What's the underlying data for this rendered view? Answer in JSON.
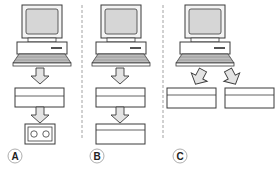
{
  "diagram": {
    "colors": {
      "stroke": "#3a3a3a",
      "screen_fill": "#d6d6d6",
      "arrow_fill": "#e4e4e4",
      "box_fill": "#ffffff",
      "divider": "#8a8a8a",
      "label_circle": "#999999"
    },
    "panels": [
      {
        "id": "A",
        "label": "A",
        "components": [
          "computer",
          "arrow-down",
          "output-box",
          "arrow-down",
          "cassette-device"
        ]
      },
      {
        "id": "B",
        "label": "B",
        "components": [
          "computer",
          "arrow-down",
          "output-box",
          "arrow-down",
          "output-box"
        ]
      },
      {
        "id": "C",
        "label": "C",
        "components": [
          "computer",
          "arrow-down-left",
          "arrow-down-right",
          "output-box",
          "output-box"
        ]
      }
    ]
  }
}
